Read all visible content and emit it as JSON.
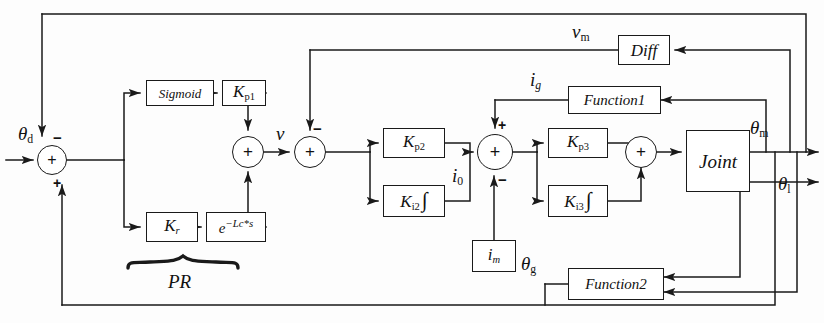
{
  "diagram": {
    "type": "control-block-diagram",
    "line_color": "#1a1a1a",
    "background": "#fdfdfd"
  },
  "blocks": {
    "sigmoid": {
      "label": "Sigmoid",
      "x": 146,
      "y": 80,
      "w": 68,
      "h": 26,
      "font": 13
    },
    "kp1": {
      "label": "Kp1",
      "x": 222,
      "y": 80,
      "w": 44,
      "h": 26,
      "font": 17
    },
    "kr": {
      "label": "Kr",
      "x": 146,
      "y": 212,
      "w": 52,
      "h": 30,
      "font": 17
    },
    "delay": {
      "label": "e-Lc*s",
      "x": 206,
      "y": 212,
      "w": 60,
      "h": 30,
      "font": 15
    },
    "kp2": {
      "label": "Kp2",
      "x": 383,
      "y": 128,
      "w": 62,
      "h": 30,
      "font": 17
    },
    "ki2": {
      "label": "Ki2",
      "x": 383,
      "y": 185,
      "w": 62,
      "h": 32,
      "font": 17
    },
    "kp3": {
      "label": "Kp3",
      "x": 548,
      "y": 128,
      "w": 60,
      "h": 30,
      "font": 17
    },
    "ki3": {
      "label": "Ki3",
      "x": 548,
      "y": 185,
      "w": 60,
      "h": 32,
      "font": 17
    },
    "im": {
      "label": "im",
      "x": 472,
      "y": 240,
      "w": 44,
      "h": 32,
      "font": 17
    },
    "joint": {
      "label": "Joint",
      "x": 686,
      "y": 130,
      "w": 64,
      "h": 62,
      "font": 19
    },
    "diff": {
      "label": "Diff",
      "x": 618,
      "y": 35,
      "w": 52,
      "h": 30,
      "font": 17
    },
    "function1": {
      "label": "Function1",
      "x": 568,
      "y": 86,
      "w": 88,
      "h": 28,
      "font": 15
    },
    "function2": {
      "label": "Function2",
      "x": 568,
      "y": 268,
      "w": 92,
      "h": 32,
      "font": 15
    }
  },
  "summing_junctions": [
    {
      "name": "theta-error-sum",
      "x": 52,
      "y": 160,
      "r": 15,
      "inner": "+",
      "top_sign": "-",
      "bottom_sign": "+"
    },
    {
      "name": "pr-sum",
      "x": 248,
      "y": 152,
      "r": 16,
      "inner": "+",
      "top_sign": "",
      "bottom_sign": ""
    },
    {
      "name": "velocity-error-sum",
      "x": 310,
      "y": 152,
      "r": 16,
      "inner": "+",
      "top_sign": "-",
      "bottom_sign": ""
    },
    {
      "name": "current-error-sum",
      "x": 495,
      "y": 152,
      "r": 18,
      "inner": "+",
      "top_sign": "+",
      "bottom_sign": "-"
    },
    {
      "name": "pi3-output-sum",
      "x": 641,
      "y": 152,
      "r": 16,
      "inner": "+",
      "top_sign": "",
      "bottom_sign": ""
    }
  ],
  "signals": {
    "theta_d": {
      "text": "θd",
      "x": 22,
      "y": 128
    },
    "v": {
      "text": "v",
      "x": 281,
      "y": 128
    },
    "i_0": {
      "text": "i0",
      "x": 457,
      "y": 168
    },
    "v_m": {
      "text": "vm",
      "x": 576,
      "y": 24
    },
    "i_g": {
      "text": "ig",
      "x": 534,
      "y": 73
    },
    "theta_m": {
      "text": "θm",
      "x": 753,
      "y": 122
    },
    "theta_l": {
      "text": "θl",
      "x": 781,
      "y": 178
    },
    "theta_g": {
      "text": "θg",
      "x": 525,
      "y": 258
    },
    "pr": {
      "text": "PR",
      "x": 181,
      "y": 282
    }
  }
}
